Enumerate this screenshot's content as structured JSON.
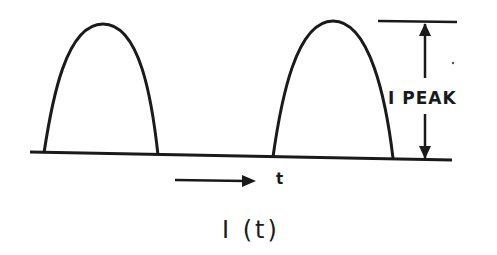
{
  "diagram": {
    "title": "I (t)",
    "peak_label": "I PEAK",
    "time_label": "t",
    "stroke_color": "#1a1a1a",
    "background": "#ffffff",
    "elements": [
      {
        "type": "baseline",
        "description": "horizontal time axis"
      },
      {
        "type": "pulse",
        "index": 1,
        "shape": "half-sine / parabolic arch",
        "start_x": 44,
        "end_x": 158,
        "peak_x": 103
      },
      {
        "type": "pulse",
        "index": 2,
        "shape": "half-sine / parabolic arch",
        "start_x": 273,
        "end_x": 393,
        "peak_x": 333
      },
      {
        "type": "reference-line",
        "description": "horizontal line at peak height"
      },
      {
        "type": "dimension-arrow",
        "description": "double-headed vertical arrow spanning baseline to peak",
        "label": "I PEAK"
      },
      {
        "type": "time-arrow",
        "description": "right-pointing arrow indicating time direction",
        "label": "t"
      }
    ]
  }
}
